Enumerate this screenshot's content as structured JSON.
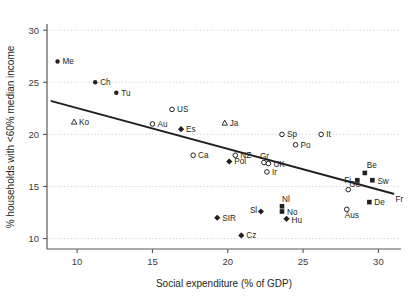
{
  "chart_data": {
    "type": "scatter",
    "title": "",
    "xlabel": "Social expenditure (% of GDP)",
    "ylabel": "% households with <60% median income",
    "xlim": [
      8.0,
      31.5
    ],
    "ylim": [
      9.0,
      30.5
    ],
    "xticks": [
      "10",
      "15",
      "20",
      "25",
      "30"
    ],
    "xtickvals": [
      10,
      15,
      20,
      25,
      30
    ],
    "yticks": [
      "10",
      "15",
      "20",
      "25",
      "30"
    ],
    "ytickvals": [
      10,
      15,
      20,
      25,
      30
    ],
    "grid": "horizontal-dotted",
    "legend": "none",
    "points": [
      {
        "label": "Me",
        "x": 8.7,
        "y": 27.0,
        "marker": "filled-circle",
        "lx": 5,
        "ly": 3
      },
      {
        "label": "Ch",
        "x": 11.2,
        "y": 25.0,
        "marker": "filled-circle",
        "lx": 5,
        "ly": 3
      },
      {
        "label": "Tu",
        "x": 12.6,
        "y": 24.0,
        "marker": "filled-circle",
        "lx": 5,
        "ly": 3
      },
      {
        "label": "Ko",
        "x": 9.8,
        "y": 21.2,
        "marker": "triangle",
        "lx": 5,
        "ly": 3
      },
      {
        "label": "US",
        "x": 16.3,
        "y": 22.4,
        "marker": "open-circle",
        "lx": 5,
        "ly": 3
      },
      {
        "label": "Au",
        "x": 15.0,
        "y": 21.0,
        "marker": "open-circle",
        "lx": 5,
        "ly": 3
      },
      {
        "label": "Es",
        "x": 16.9,
        "y": 20.5,
        "marker": "filled-diamond",
        "lx": 5,
        "ly": 3
      },
      {
        "label": "Ja",
        "x": 19.8,
        "y": 21.1,
        "marker": "triangle",
        "lx": 5,
        "ly": 3
      },
      {
        "label": "Sp",
        "x": 23.6,
        "y": 20.0,
        "marker": "open-circle",
        "lx": 5,
        "ly": 3
      },
      {
        "label": "It",
        "x": 26.2,
        "y": 20.0,
        "marker": "open-circle",
        "lx": 5,
        "ly": 3
      },
      {
        "label": "Po",
        "x": 24.5,
        "y": 19.0,
        "marker": "open-circle",
        "lx": 5,
        "ly": 3
      },
      {
        "label": "Ca",
        "x": 17.7,
        "y": 18.0,
        "marker": "open-circle",
        "lx": 5,
        "ly": 3
      },
      {
        "label": "NZ",
        "x": 20.5,
        "y": 18.0,
        "marker": "open-circle",
        "lx": 5,
        "ly": 3
      },
      {
        "label": "Gr",
        "x": 22.4,
        "y": 17.3,
        "marker": "open-circle",
        "lx": -4,
        "ly": -4
      },
      {
        "label": "Pol",
        "x": 20.1,
        "y": 17.4,
        "marker": "filled-diamond",
        "lx": 5,
        "ly": 3
      },
      {
        "label": "UK",
        "x": 22.7,
        "y": 17.2,
        "marker": "open-circle",
        "lx": 5,
        "ly": 3
      },
      {
        "label": "Ir",
        "x": 22.6,
        "y": 16.4,
        "marker": "open-circle",
        "lx": 5,
        "ly": 3
      },
      {
        "label": "Be",
        "x": 29.1,
        "y": 16.3,
        "marker": "filled-square",
        "lx": 2,
        "ly": -5
      },
      {
        "label": "Fi",
        "x": 28.6,
        "y": 15.6,
        "marker": "filled-square",
        "lx": -13,
        "ly": 3
      },
      {
        "label": "Sw",
        "x": 29.6,
        "y": 15.6,
        "marker": "filled-square",
        "lx": 5,
        "ly": 4
      },
      {
        "label": "Ge",
        "x": 28.0,
        "y": 14.7,
        "marker": "open-circle",
        "lx": 1,
        "ly": -3
      },
      {
        "label": "Fr",
        "x": 31.0,
        "y": 13.8,
        "marker": "none",
        "lx": 2,
        "ly": 3
      },
      {
        "label": "De",
        "x": 29.4,
        "y": 13.5,
        "marker": "filled-square",
        "lx": 5,
        "ly": 3
      },
      {
        "label": "Aus",
        "x": 27.9,
        "y": 12.8,
        "marker": "open-circle",
        "lx": -2,
        "ly": 9
      },
      {
        "label": "Nl",
        "x": 23.6,
        "y": 13.1,
        "marker": "filled-square",
        "lx": 0,
        "ly": -4
      },
      {
        "label": "Sl",
        "x": 22.2,
        "y": 12.6,
        "marker": "filled-diamond",
        "lx": -11,
        "ly": 2
      },
      {
        "label": "No",
        "x": 23.6,
        "y": 12.6,
        "marker": "filled-square",
        "lx": 5,
        "ly": 4
      },
      {
        "label": "Hu",
        "x": 23.9,
        "y": 11.9,
        "marker": "filled-diamond",
        "lx": 5,
        "ly": 4
      },
      {
        "label": "SIR",
        "x": 19.3,
        "y": 12.0,
        "marker": "filled-diamond",
        "lx": 5,
        "ly": 3
      },
      {
        "label": "Cz",
        "x": 20.9,
        "y": 10.3,
        "marker": "filled-diamond",
        "lx": 5,
        "ly": 3
      }
    ],
    "trendline": {
      "x1": 8.3,
      "y1": 23.2,
      "x2": 31.0,
      "y2": 14.3,
      "color": "#231f20"
    },
    "colors": {
      "marker": "#231f20",
      "grid": "#c9c7c9",
      "axis": "#58585b",
      "text": "#231f20"
    }
  }
}
